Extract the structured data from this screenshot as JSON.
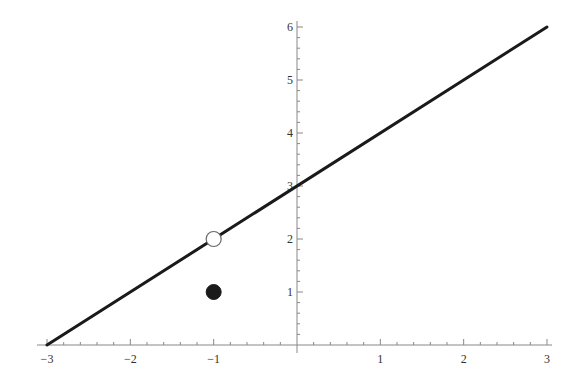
{
  "chart_data": {
    "type": "line",
    "title": "",
    "xlabel": "",
    "ylabel": "",
    "xlim": [
      -3,
      3
    ],
    "ylim": [
      0,
      6
    ],
    "grid": false,
    "legend": null,
    "x_ticks": [
      -3,
      -2,
      -1,
      1,
      2,
      3
    ],
    "y_ticks": [
      1,
      2,
      3,
      4,
      5,
      6
    ],
    "x_tick_labels": [
      "−3",
      "−2",
      "−1",
      "1",
      "2",
      "3"
    ],
    "y_tick_labels": [
      "1",
      "2",
      "3",
      "4",
      "5",
      "6"
    ],
    "series": [
      {
        "name": "y = x + 3",
        "kind": "line",
        "x": [
          -3,
          3
        ],
        "y": [
          0,
          6
        ],
        "color": "#1a1a1a"
      },
      {
        "name": "open point (hole)",
        "kind": "point",
        "marker": "open-circle",
        "x": [
          -1
        ],
        "y": [
          2
        ],
        "color": "#1a1a1a"
      },
      {
        "name": "filled point",
        "kind": "point",
        "marker": "filled-circle",
        "x": [
          -1
        ],
        "y": [
          1
        ],
        "color": "#1a1a1a"
      }
    ]
  },
  "layout": {
    "origin_px": [
      297,
      345
    ],
    "px_per_unit_x": 83.33,
    "px_per_unit_y": 53,
    "axis_color": "#888888",
    "line_color": "#1a1a1a"
  }
}
